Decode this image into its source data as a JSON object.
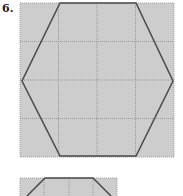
{
  "problem": {
    "number": "6."
  },
  "colors": {
    "grid_fill": "#cdcdcd",
    "grid_line": "#8a8a8a",
    "shape_stroke": "#4a4a4a"
  },
  "figure1": {
    "shape": "hexagon",
    "grid": "4x4"
  },
  "figure2": {
    "shape": "trapezoid",
    "grid": "4 columns (partial)"
  }
}
